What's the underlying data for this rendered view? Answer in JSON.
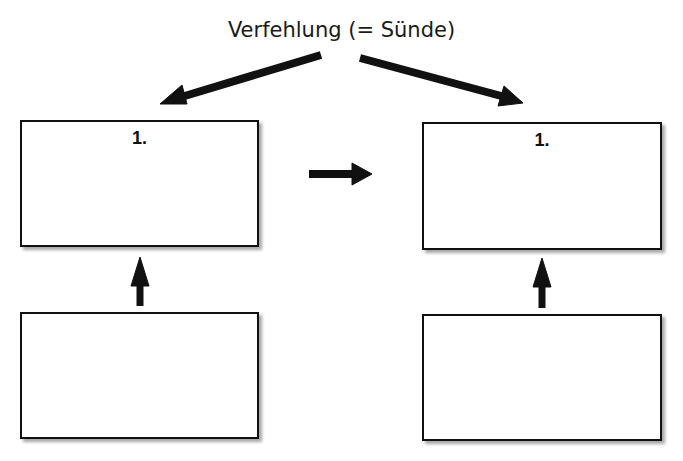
{
  "title": "Verfehlung (= Sünde)",
  "boxes": {
    "top_left": {
      "label": "1."
    },
    "top_right": {
      "label": "1."
    },
    "bottom_left": {
      "label": ""
    },
    "bottom_right": {
      "label": ""
    }
  },
  "colors": {
    "stroke": "#111111",
    "background": "#ffffff"
  }
}
